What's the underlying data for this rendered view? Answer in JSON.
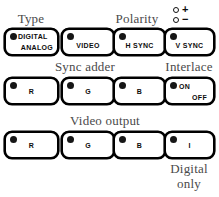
{
  "panel": {
    "groups": {
      "type": "Type",
      "polarity": "Polarity",
      "sync_adder": "Sync adder",
      "interlace": "Interlace",
      "video_output": "Video output",
      "digital_only_line1": "Digital",
      "digital_only_line2": "only"
    },
    "polarity_indicators": [
      {
        "sign": "+",
        "state": "off",
        "color": "#121212"
      },
      {
        "sign": "−",
        "state": "off",
        "color": "#121212"
      }
    ],
    "rows": [
      {
        "name": "type-polarity-row",
        "buttons": [
          {
            "name": "digital-analog",
            "line1": "DIGITAL",
            "line2": "ANALOG",
            "led": true
          },
          {
            "name": "video",
            "label": "VIDEO",
            "led": true
          },
          {
            "name": "h-sync",
            "label": "H SYNC",
            "led": true
          },
          {
            "name": "v-sync",
            "label": "V SYNC",
            "led": true
          }
        ]
      },
      {
        "name": "sync-adder-interlace-row",
        "buttons": [
          {
            "name": "sync-adder-r",
            "label": "R",
            "led": true
          },
          {
            "name": "sync-adder-g",
            "label": "G",
            "led": true
          },
          {
            "name": "sync-adder-b",
            "label": "B",
            "led": true
          },
          {
            "name": "interlace-on-off",
            "line1": "ON",
            "line2": "OFF",
            "led": true
          }
        ]
      },
      {
        "name": "video-output-row",
        "buttons": [
          {
            "name": "video-output-r",
            "label": "R",
            "led": true
          },
          {
            "name": "video-output-g",
            "label": "G",
            "led": true
          },
          {
            "name": "video-output-b",
            "label": "B",
            "led": true
          },
          {
            "name": "video-output-i",
            "label": "I",
            "led": true
          }
        ]
      }
    ],
    "colors": {
      "label_text": "#4a4a4a",
      "button_border": "#000000",
      "button_face": "#ffffff",
      "led_on": "#161616"
    }
  }
}
